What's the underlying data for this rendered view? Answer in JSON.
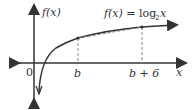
{
  "diagram": {
    "type": "function-graph",
    "function_label": "f(x) = log₂x",
    "function_label_parts": {
      "lhs": "f(x) =",
      "log": "log",
      "base": "2",
      "arg": "x"
    },
    "y_axis_label": "f(x)",
    "x_axis_label": "x",
    "origin_label": "0",
    "points": [
      {
        "label": "b"
      },
      {
        "label": "b + 6"
      }
    ],
    "secant": "dashed line connecting (b, f(b)) and (b+6, f(b+6))",
    "colors": {
      "curve": "#333333",
      "axes": "#333333",
      "dashed": "#888888"
    }
  }
}
